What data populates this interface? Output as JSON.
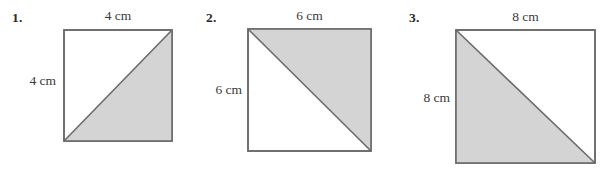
{
  "worksheet": {
    "figures": [
      {
        "number": "1.",
        "top_label": "4 cm",
        "left_label": "4 cm",
        "side_cm": 4,
        "shaded_region": "lower-right",
        "diagonal": "bottom-left-to-top-right",
        "square_px": {
          "x": 63,
          "y": 29,
          "width": 109,
          "height": 112
        }
      },
      {
        "number": "2.",
        "top_label": "6 cm",
        "left_label": "6 cm",
        "side_cm": 6,
        "shaded_region": "upper-right",
        "diagonal": "top-left-to-bottom-right",
        "square_px": {
          "x": 247,
          "y": 28,
          "width": 124,
          "height": 123
        }
      },
      {
        "number": "3.",
        "top_label": "8 cm",
        "left_label": "8 cm",
        "side_cm": 8,
        "shaded_region": "lower-left",
        "diagonal": "top-left-to-bottom-right",
        "square_px": {
          "x": 455,
          "y": 29,
          "width": 140,
          "height": 134
        }
      }
    ]
  },
  "style": {
    "shade_color": "#d4d4d4",
    "stroke_color": "#6b6b6b",
    "background_color": "#ffffff",
    "text_color": "#3b3b3b"
  }
}
